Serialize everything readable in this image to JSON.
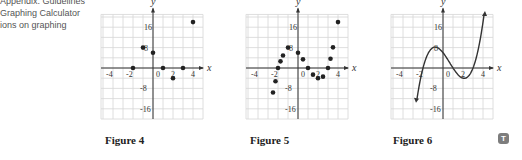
{
  "side_text": {
    "lines": [
      "Appendix: Guidelines",
      "Graphing Calculator",
      "ions on graphing"
    ]
  },
  "figures": [
    {
      "caption": "Figure 4",
      "kind": "scatter",
      "points": [
        [
          -2,
          0
        ],
        [
          -1,
          8
        ],
        [
          0,
          6
        ],
        [
          1,
          0
        ],
        [
          2,
          -4
        ],
        [
          3,
          0
        ],
        [
          4,
          18
        ]
      ]
    },
    {
      "caption": "Figure 5",
      "kind": "scatter",
      "points": [
        [
          -2.5,
          -9.6
        ],
        [
          -2.25,
          -5.2
        ],
        [
          -2,
          0
        ],
        [
          -1.75,
          2.6
        ],
        [
          -1.5,
          4.9
        ],
        [
          -1,
          8
        ],
        [
          0,
          6
        ],
        [
          0.5,
          3.4
        ],
        [
          1,
          0
        ],
        [
          1.5,
          -2.6
        ],
        [
          2,
          -4
        ],
        [
          2.5,
          -3.4
        ],
        [
          3,
          0
        ],
        [
          3.25,
          3.6
        ],
        [
          3.5,
          8.1
        ],
        [
          4,
          18
        ]
      ]
    },
    {
      "caption": "Figure 6",
      "kind": "curve",
      "function": "(x+2)(x-1)(x-3)",
      "x_range": [
        -2.6,
        4.1
      ]
    }
  ],
  "axes": {
    "x_label": "x",
    "y_label": "y",
    "x_ticks": [
      "-4",
      "-2",
      "0",
      "2",
      "4"
    ],
    "y_ticks": [
      "16",
      "8",
      "-8",
      "-16"
    ]
  },
  "chart_data": [
    {
      "type": "scatter",
      "title": "Figure 4",
      "xlabel": "x",
      "ylabel": "y",
      "x": [
        -2,
        -1,
        0,
        1,
        2,
        3,
        4
      ],
      "y": [
        0,
        8,
        6,
        0,
        -4,
        0,
        18
      ],
      "xlim": [
        -5,
        5
      ],
      "ylim": [
        -20,
        20
      ],
      "grid": true
    },
    {
      "type": "scatter",
      "title": "Figure 5",
      "xlabel": "x",
      "ylabel": "y",
      "x": [
        -2.5,
        -2.25,
        -2,
        -1.75,
        -1.5,
        -1,
        0,
        0.5,
        1,
        1.5,
        2,
        2.5,
        3,
        3.25,
        3.5,
        4
      ],
      "y": [
        -9.6,
        -5.2,
        0,
        2.6,
        4.9,
        8,
        6,
        3.4,
        0,
        -2.6,
        -4,
        -3.4,
        0,
        3.6,
        8.1,
        18
      ],
      "xlim": [
        -5,
        5
      ],
      "ylim": [
        -20,
        20
      ],
      "grid": true
    },
    {
      "type": "line",
      "title": "Figure 6",
      "xlabel": "x",
      "ylabel": "y",
      "function": "y = (x+2)(x-1)(x-3)",
      "x": [
        -2.6,
        -2,
        -1,
        0,
        1,
        2,
        3,
        4
      ],
      "y": [
        -15.1,
        0,
        8,
        6,
        0,
        -4,
        0,
        18
      ],
      "xlim": [
        -5,
        5
      ],
      "ylim": [
        -20,
        20
      ],
      "grid": true
    }
  ],
  "badge": {
    "label": "T"
  }
}
